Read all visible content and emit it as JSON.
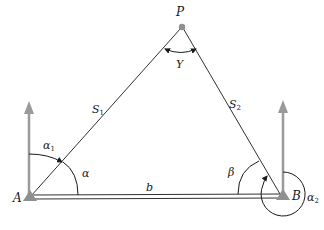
{
  "diagram": {
    "type": "surveying-triangulation",
    "points": {
      "A": {
        "label": "A",
        "x": 30,
        "y": 196
      },
      "B": {
        "label": "B",
        "x": 283,
        "y": 195
      },
      "P": {
        "label": "P",
        "x": 182,
        "y": 27
      }
    },
    "sides": {
      "S1": {
        "label": "S",
        "sub": "1"
      },
      "S2": {
        "label": "S",
        "sub": "2"
      },
      "b": {
        "label": "b"
      }
    },
    "angles": {
      "gamma": {
        "label": "Y"
      },
      "alpha": {
        "label": "α"
      },
      "alpha1": {
        "label": "α",
        "sub": "1"
      },
      "beta": {
        "label": "β"
      },
      "alpha2": {
        "label": "α",
        "sub": "2"
      }
    },
    "colors": {
      "line": "#1a1a1a",
      "north_arrow": "#9a9a9a",
      "point_marker": "#8f8f8f"
    }
  }
}
